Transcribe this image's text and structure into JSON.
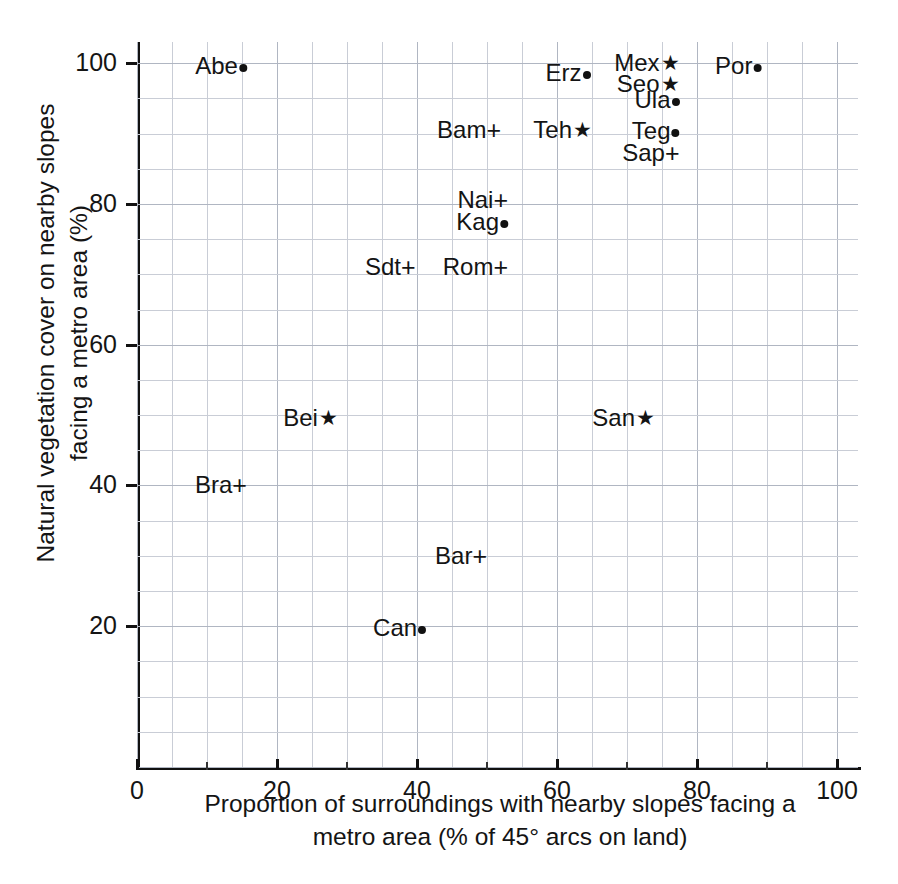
{
  "chart_data": {
    "type": "scatter",
    "title": "",
    "xlabel": "Proportion of surroundings with nearby slopes facing a metro area (% of 45° arcs on land)",
    "xlabel_line1": "Proportion of surroundings with nearby slopes facing a",
    "xlabel_line2": "metro area (% of 45° arcs on land)",
    "ylabel": "Natural vegetation cover on nearby slopes facing a metro area (%)",
    "ylabel_line1": "Natural vegetation cover on nearby slopes",
    "ylabel_line2": "facing a metro area (%)",
    "xlim": [
      0,
      103
    ],
    "ylim": [
      0,
      103
    ],
    "xticks": [
      0,
      20,
      40,
      60,
      80,
      100
    ],
    "xticklabels": [
      "0",
      "20",
      "40",
      "60",
      "80",
      "100"
    ],
    "xticks_minor": [
      10,
      30,
      50,
      70,
      90
    ],
    "yticks": [
      20,
      40,
      60,
      80,
      100
    ],
    "yticklabels": [
      "20",
      "40",
      "60",
      "80",
      "100"
    ],
    "grid": true,
    "grid_step": 5,
    "legend": "none",
    "marker_glyphs": {
      "dot": "●",
      "star": "★",
      "plus": "+"
    },
    "points": [
      {
        "label": "Abe",
        "marker": "dot",
        "x": 15.7,
        "y": 99.6
      },
      {
        "label": "Erz",
        "marker": "dot",
        "x": 64.8,
        "y": 98.6
      },
      {
        "label": "Mex",
        "marker": "star",
        "x": 77.5,
        "y": 100.0
      },
      {
        "label": "Por",
        "marker": "dot",
        "x": 89.2,
        "y": 99.6
      },
      {
        "label": "Seo",
        "marker": "star",
        "x": 77.5,
        "y": 97.0
      },
      {
        "label": "Ula",
        "marker": "dot",
        "x": 77.5,
        "y": 94.8
      },
      {
        "label": "Bam",
        "marker": "plus",
        "x": 52.0,
        "y": 90.5
      },
      {
        "label": "Teh",
        "marker": "star",
        "x": 65.0,
        "y": 90.5
      },
      {
        "label": "Teg",
        "marker": "dot",
        "x": 77.5,
        "y": 90.3
      },
      {
        "label": "Sap",
        "marker": "plus",
        "x": 77.5,
        "y": 87.3
      },
      {
        "label": "Nai",
        "marker": "plus",
        "x": 53.0,
        "y": 80.5
      },
      {
        "label": "Kag",
        "marker": "dot",
        "x": 53.0,
        "y": 77.5
      },
      {
        "label": "Sdt",
        "marker": "plus",
        "x": 39.8,
        "y": 71.0
      },
      {
        "label": "Rom",
        "marker": "plus",
        "x": 53.0,
        "y": 71.0
      },
      {
        "label": "Bei",
        "marker": "star",
        "x": 28.7,
        "y": 49.6
      },
      {
        "label": "San",
        "marker": "star",
        "x": 74.0,
        "y": 49.6
      },
      {
        "label": "Bra",
        "marker": "plus",
        "x": 15.7,
        "y": 40.0
      },
      {
        "label": "Bar",
        "marker": "plus",
        "x": 50.0,
        "y": 30.0
      },
      {
        "label": "Can",
        "marker": "dot",
        "x": 41.3,
        "y": 19.8
      }
    ]
  }
}
